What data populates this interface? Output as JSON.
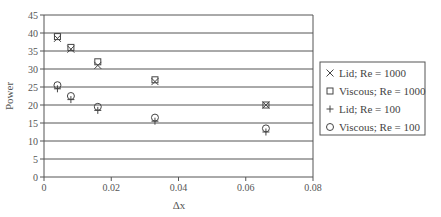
{
  "chart_data": {
    "type": "scatter",
    "title": "",
    "xlabel": "Δx",
    "ylabel": "Power",
    "xlim": [
      0,
      0.08
    ],
    "ylim": [
      0,
      45
    ],
    "x_ticks": [
      0,
      0.02,
      0.04,
      0.06,
      0.08
    ],
    "x_tick_labels": [
      "0",
      "0.02",
      "0.04",
      "0.06",
      "0.08"
    ],
    "y_ticks": [
      0,
      5,
      10,
      15,
      20,
      25,
      30,
      35,
      40,
      45
    ],
    "y_tick_labels": [
      "0",
      "5",
      "10",
      "15",
      "20",
      "25",
      "30",
      "35",
      "40",
      "45"
    ],
    "grid": "horizontal",
    "legend_position": "right",
    "x": [
      0.004,
      0.008,
      0.016,
      0.033,
      0.066
    ],
    "series": [
      {
        "name": "Lid;  Re = 1000",
        "marker": "x",
        "values": [
          38.5,
          35.5,
          31.0,
          26.5,
          20.0
        ]
      },
      {
        "name": "Viscous;  Re = 1000",
        "marker": "square",
        "values": [
          39.0,
          36.0,
          32.0,
          27.0,
          20.0
        ]
      },
      {
        "name": "Lid;  Re = 100",
        "marker": "plus",
        "values": [
          24.5,
          21.5,
          18.5,
          15.5,
          12.5
        ]
      },
      {
        "name": "Viscous;  Re = 100",
        "marker": "circle",
        "values": [
          25.5,
          22.5,
          19.5,
          16.5,
          13.5
        ]
      }
    ]
  },
  "colors": {
    "axis": "#555555",
    "grid": "#555555",
    "marker": "#444444",
    "background": "#ffffff"
  }
}
